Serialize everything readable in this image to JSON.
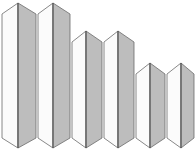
{
  "chart_data": {
    "type": "bar",
    "title": "",
    "subtitle": "",
    "xlabel": "",
    "ylabel": "",
    "categories": [
      "1",
      "2",
      "3",
      "4",
      "5",
      "6"
    ],
    "values": [
      100,
      100,
      77,
      77,
      54,
      54
    ],
    "ylim": [
      0,
      100
    ],
    "grid": false,
    "legend": null,
    "style": "3d-chevron-prism-bars",
    "series": [
      {
        "name": "Series 1",
        "values": [
          100,
          100,
          77,
          77,
          54,
          54
        ]
      }
    ],
    "bars": [
      {
        "category": "1",
        "value": 100,
        "x_left": 2,
        "x_ridge": 18,
        "x_right": 36,
        "apex_y": 3,
        "shoulder_y": 14,
        "base_shoulder_y": 138,
        "base_tip_y": 148
      },
      {
        "category": "2",
        "value": 100,
        "x_left": 38,
        "x_ridge": 53,
        "x_right": 70,
        "apex_y": 3,
        "shoulder_y": 14,
        "base_shoulder_y": 138,
        "base_tip_y": 148
      },
      {
        "category": "3",
        "value": 77,
        "x_left": 72,
        "x_ridge": 86,
        "x_right": 102,
        "apex_y": 31,
        "shoulder_y": 42,
        "base_shoulder_y": 138,
        "base_tip_y": 148
      },
      {
        "category": "4",
        "value": 77,
        "x_left": 104,
        "x_ridge": 118,
        "x_right": 134,
        "apex_y": 31,
        "shoulder_y": 42,
        "base_shoulder_y": 138,
        "base_tip_y": 148
      },
      {
        "category": "5",
        "value": 54,
        "x_left": 136,
        "x_ridge": 150,
        "x_right": 165,
        "apex_y": 63,
        "shoulder_y": 74,
        "base_shoulder_y": 138,
        "base_tip_y": 148
      },
      {
        "category": "6",
        "value": 54,
        "x_left": 167,
        "x_ridge": 181,
        "x_right": 194,
        "apex_y": 63,
        "shoulder_y": 74,
        "base_shoulder_y": 138,
        "base_tip_y": 148
      }
    ],
    "axis_tick_labels": [
      "",
      "",
      "",
      "",
      "",
      ""
    ]
  },
  "colors": {
    "background": "#ffffff",
    "bar_left_face": "#fbfbfb",
    "bar_right_face": "#bdbdbd",
    "bar_outline": "#6b6b6b",
    "bar_ridge": "#4a4a4a",
    "axis_label_text": "#d2d2d2"
  },
  "accessibility": {
    "chart_description": "Descending stepped bar chart with six 3D chevron-shaped bars in three height tiers."
  }
}
